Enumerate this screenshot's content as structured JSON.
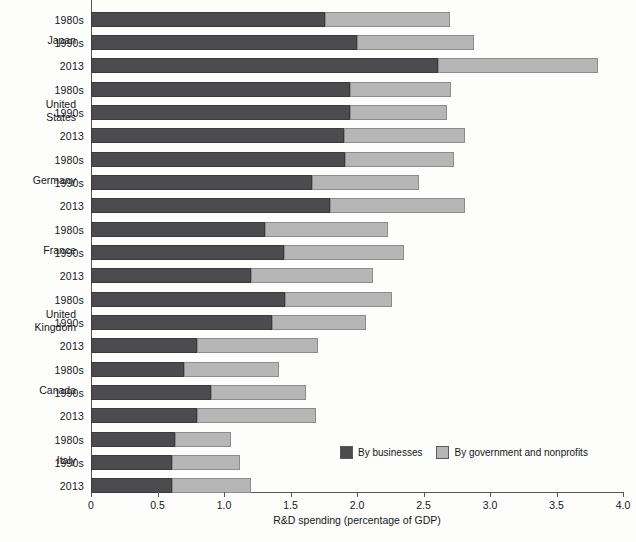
{
  "chart_data": {
    "type": "bar",
    "orientation": "horizontal",
    "stacked": true,
    "title": "",
    "xlabel": "R&D spending (percentage of GDP)",
    "ylabel": "",
    "xlim": [
      0,
      4.0
    ],
    "xticks": [
      "0",
      "0.5",
      "1.0",
      "1.5",
      "2.0",
      "2.5",
      "3.0",
      "3.5",
      "4.0"
    ],
    "xtick_values": [
      0,
      0.5,
      1.0,
      1.5,
      2.0,
      2.5,
      3.0,
      3.5,
      4.0
    ],
    "grid": false,
    "legend_position": "bottom-right",
    "series": [
      {
        "name": "By businesses",
        "color": "#4c4c4e"
      },
      {
        "name": "By government and nonprofits",
        "color": "#b6b6b6"
      }
    ],
    "groups": [
      {
        "country": "Japan",
        "rows": [
          {
            "period": "1980s",
            "businesses": 1.76,
            "government": 0.94,
            "total": 2.7
          },
          {
            "period": "1990s",
            "businesses": 2.0,
            "government": 0.88,
            "total": 2.88
          },
          {
            "period": "2013",
            "businesses": 2.61,
            "government": 1.2,
            "total": 3.81
          }
        ]
      },
      {
        "country": "United States",
        "rows": [
          {
            "period": "1980s",
            "businesses": 1.95,
            "government": 0.76,
            "total": 2.71
          },
          {
            "period": "1990s",
            "businesses": 1.95,
            "government": 0.73,
            "total": 2.68
          },
          {
            "period": "2013",
            "businesses": 1.9,
            "government": 0.91,
            "total": 2.81
          }
        ]
      },
      {
        "country": "Germany",
        "rows": [
          {
            "period": "1980s",
            "businesses": 1.91,
            "government": 0.82,
            "total": 2.73
          },
          {
            "period": "1990s",
            "businesses": 1.66,
            "government": 0.81,
            "total": 2.47
          },
          {
            "period": "2013",
            "businesses": 1.8,
            "government": 1.01,
            "total": 2.81
          }
        ]
      },
      {
        "country": "France",
        "rows": [
          {
            "period": "1980s",
            "businesses": 1.31,
            "government": 0.92,
            "total": 2.23
          },
          {
            "period": "1990s",
            "businesses": 1.45,
            "government": 0.9,
            "total": 2.35
          },
          {
            "period": "2013",
            "businesses": 1.2,
            "government": 0.92,
            "total": 2.12
          }
        ]
      },
      {
        "country": "United Kingdom",
        "rows": [
          {
            "period": "1980s",
            "businesses": 1.46,
            "government": 0.8,
            "total": 2.26
          },
          {
            "period": "1990s",
            "businesses": 1.36,
            "government": 0.71,
            "total": 2.07
          },
          {
            "period": "2013",
            "businesses": 0.8,
            "government": 0.91,
            "total": 1.71
          }
        ]
      },
      {
        "country": "Canada",
        "rows": [
          {
            "period": "1980s",
            "businesses": 0.7,
            "government": 0.71,
            "total": 1.41
          },
          {
            "period": "1990s",
            "businesses": 0.9,
            "government": 0.72,
            "total": 1.62
          },
          {
            "period": "2013",
            "businesses": 0.8,
            "government": 0.89,
            "total": 1.69
          }
        ]
      },
      {
        "country": "Italy",
        "rows": [
          {
            "period": "1980s",
            "businesses": 0.63,
            "government": 0.42,
            "total": 1.05
          },
          {
            "period": "1990s",
            "businesses": 0.61,
            "government": 0.51,
            "total": 1.12
          },
          {
            "period": "2013",
            "businesses": 0.61,
            "government": 0.59,
            "total": 1.2
          }
        ]
      }
    ]
  },
  "legend": {
    "items": [
      {
        "label": "By businesses",
        "color": "#4c4c4e"
      },
      {
        "label": "By government and nonprofits",
        "color": "#b6b6b6"
      }
    ]
  },
  "axis": {
    "x_title": "R&D spending (percentage of GDP)"
  },
  "colors": {
    "businesses": "#4c4c4e",
    "government": "#b6b6b6",
    "axis": "#55565a",
    "background": "#fdfdfc"
  }
}
